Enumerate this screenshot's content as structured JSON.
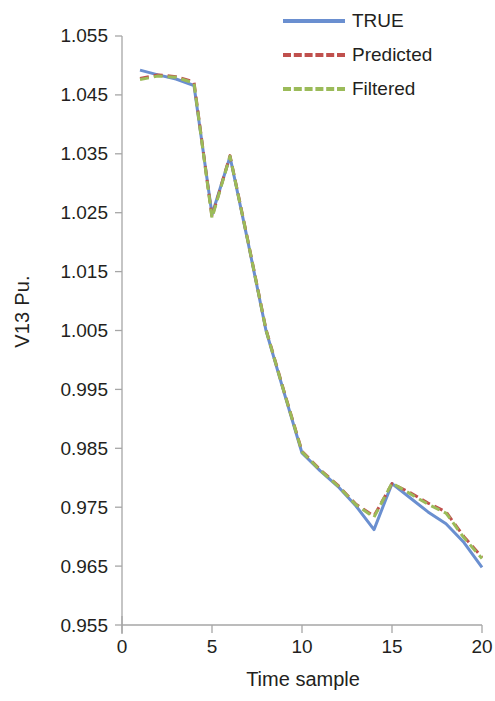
{
  "chart_data": {
    "type": "line",
    "title": "",
    "xlabel": "Time sample",
    "ylabel": "V13 Pu.",
    "xlim": [
      0,
      20
    ],
    "ylim": [
      0.955,
      1.055
    ],
    "xticks": [
      "0",
      "5",
      "10",
      "15",
      "20"
    ],
    "yticks": [
      "1.055",
      "1.045",
      "1.035",
      "1.025",
      "1.015",
      "1.005",
      "0.995",
      "0.985",
      "0.975",
      "0.965",
      "0.955"
    ],
    "grid": false,
    "legend_position": "top-right",
    "x": [
      1,
      2,
      3,
      4,
      5,
      6,
      7,
      8,
      9,
      10,
      11,
      12,
      13,
      14,
      15,
      16,
      17,
      18,
      19,
      20
    ],
    "series": [
      {
        "name": "TRUE",
        "color": "#6a8fd0",
        "style": "solid",
        "values": [
          1.0492,
          1.0484,
          1.0477,
          1.0466,
          1.0247,
          1.0345,
          1.02,
          1.005,
          0.9945,
          0.9842,
          0.9812,
          0.9785,
          0.9752,
          0.9712,
          0.979,
          0.9766,
          0.9742,
          0.9722,
          0.969,
          0.9648
        ]
      },
      {
        "name": "Predicted",
        "color": "#c0504d",
        "style": "dashed",
        "values": [
          1.0478,
          1.0484,
          1.0481,
          1.0472,
          1.0243,
          1.0347,
          1.0202,
          1.0052,
          0.9947,
          0.9845,
          0.9814,
          0.9787,
          0.9755,
          0.9735,
          0.979,
          0.9775,
          0.9757,
          0.9742,
          0.97,
          0.9665
        ]
      },
      {
        "name": "Filtered",
        "color": "#9bbb59",
        "style": "dashed",
        "values": [
          1.0476,
          1.0482,
          1.048,
          1.047,
          1.0241,
          1.0346,
          1.0201,
          1.0051,
          0.9946,
          0.9844,
          0.9813,
          0.9786,
          0.9754,
          0.9733,
          0.9791,
          0.9773,
          0.9755,
          0.974,
          0.9698,
          0.9663
        ]
      }
    ]
  },
  "axis": {
    "y_title": "V13 Pu.",
    "x_title": "Time sample",
    "y_tick_labels": [
      "1.055",
      "1.045",
      "1.035",
      "1.025",
      "1.015",
      "1.005",
      "0.995",
      "0.985",
      "0.975",
      "0.965",
      "0.955"
    ],
    "x_tick_labels": [
      "0",
      "5",
      "10",
      "15",
      "20"
    ],
    "axis_color": "#a6a6a6"
  },
  "legend": {
    "items": [
      {
        "label": "TRUE",
        "color": "#6a8fd0",
        "style": "solid"
      },
      {
        "label": "Predicted",
        "color": "#c0504d",
        "style": "dashed"
      },
      {
        "label": "Filtered",
        "color": "#9bbb59",
        "style": "dashed"
      }
    ]
  }
}
